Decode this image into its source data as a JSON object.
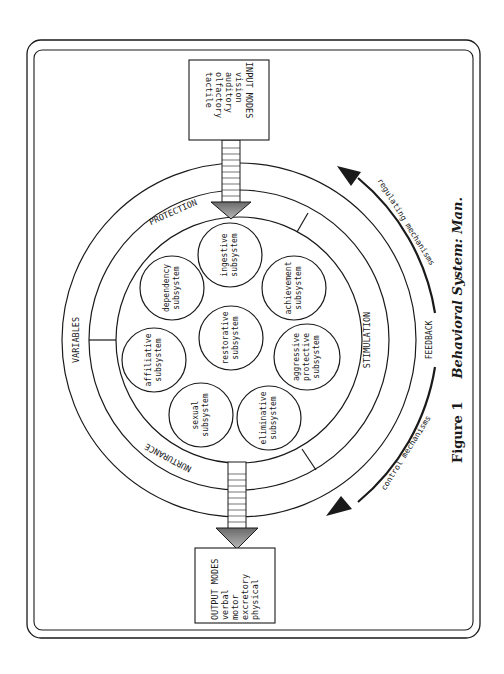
{
  "figure": {
    "caption_number": "Figure 1",
    "caption_title": "Behavioral System: Man."
  },
  "input_box": {
    "title": "INPUT MODES",
    "items": [
      "vision",
      "auditory",
      "olfactory",
      "tactile"
    ]
  },
  "output_box": {
    "title": "OUTPUT MODES",
    "items": [
      "verbal",
      "motor",
      "excretory",
      "physical"
    ]
  },
  "rings": {
    "outer_label": "VARIABLES",
    "middle_labels": {
      "top": "PROTECTION",
      "bottom": "NURTURANCE",
      "right": "STIMULATION"
    }
  },
  "subsystems": [
    {
      "line1": "ingestive",
      "line2": "subsystem"
    },
    {
      "line1": "achievement",
      "line2": "subsystem"
    },
    {
      "line1": "aggressive",
      "line2": "protective",
      "line3": "subsystem"
    },
    {
      "line1": "eliminative",
      "line2": "subsystem"
    },
    {
      "line1": "sexual",
      "line2": "subsystem"
    },
    {
      "line1": "affiliative",
      "line2": "subsystem"
    },
    {
      "line1": "dependency",
      "line2": "subsystem"
    },
    {
      "line1": "restorative",
      "line2": "subsystem"
    }
  ],
  "feedback": {
    "label": "FEEDBACK",
    "upper_label": "regulating mechanisms",
    "lower_label": "control mechanisms"
  },
  "colors": {
    "ink": "#1a1a1a",
    "paper": "#ffffff",
    "arrow_fill": "#8a8a8a"
  }
}
